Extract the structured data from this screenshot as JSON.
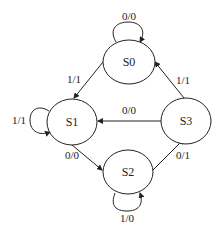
{
  "diagram": {
    "type": "state-machine",
    "states": [
      {
        "id": "S0",
        "label": "S0"
      },
      {
        "id": "S1",
        "label": "S1"
      },
      {
        "id": "S2",
        "label": "S2"
      },
      {
        "id": "S3",
        "label": "S3"
      }
    ],
    "transitions": [
      {
        "from": "S0",
        "to": "S0",
        "label": "0/0"
      },
      {
        "from": "S0",
        "to": "S1",
        "label": "1/1"
      },
      {
        "from": "S1",
        "to": "S1",
        "label": "1/1"
      },
      {
        "from": "S1",
        "to": "S2",
        "label": "0/0"
      },
      {
        "from": "S2",
        "to": "S2",
        "label": "1/0"
      },
      {
        "from": "S2",
        "to": "S3",
        "label": "0/1"
      },
      {
        "from": "S3",
        "to": "S1",
        "label": "0/0"
      },
      {
        "from": "S3",
        "to": "S0",
        "label": "1/1"
      }
    ]
  }
}
